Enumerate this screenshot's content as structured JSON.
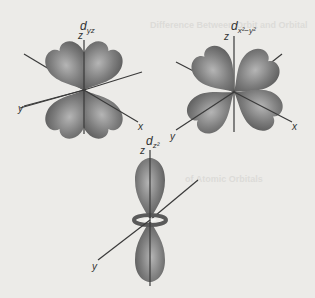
{
  "figure": {
    "orbitals": [
      {
        "id": "dyz",
        "label_main": "d",
        "label_sub": "yz",
        "axes": {
          "z": "z",
          "y": "y",
          "x": "x"
        }
      },
      {
        "id": "dx2y2",
        "label_main": "d",
        "label_sub": "x²−y²",
        "axes": {
          "z": "z",
          "y": "y",
          "x": "x"
        }
      },
      {
        "id": "dz2",
        "label_main": "d",
        "label_sub": "z²",
        "axes": {
          "z": "z",
          "y": "y"
        }
      }
    ],
    "colors": {
      "lobe_dark": "#5e5e5e",
      "lobe_light": "#a9a9a9",
      "axis": "#3a3a3a",
      "background": "#ecebe8",
      "label": "#333333"
    }
  },
  "bleed_through": {
    "heading_1": "Difference Between Orbit and Orbital",
    "heading_2": "of Atomic Orbitals"
  }
}
